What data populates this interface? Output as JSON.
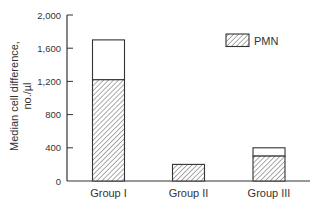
{
  "chart_data": {
    "type": "bar",
    "stacked": true,
    "title": "",
    "xlabel": "",
    "ylabel": "Median cell difference, no./µl",
    "ylabel_lines": [
      "Median cell difference,",
      "no./µl"
    ],
    "ylim": [
      0,
      2000
    ],
    "yticks": [
      0,
      400,
      800,
      1200,
      1600,
      2000
    ],
    "ytick_labels": [
      "0",
      "400",
      "800",
      "1,200",
      "1,600",
      "2,000"
    ],
    "categories": [
      "Group I",
      "Group II",
      "Group III"
    ],
    "series": [
      {
        "name": "PMN",
        "pattern": "hatched",
        "values": [
          1220,
          200,
          300
        ]
      },
      {
        "name": "Other (non-PMN)",
        "pattern": "open",
        "values": [
          480,
          0,
          100
        ]
      }
    ],
    "totals": [
      1700,
      200,
      400
    ],
    "legend": {
      "position": "upper right",
      "entries": [
        {
          "label": "PMN",
          "pattern": "hatched"
        }
      ]
    },
    "grid": false
  },
  "colors": {
    "axis": "#333333",
    "bar_outline": "#333333",
    "hatch": "#555555",
    "open_fill": "#ffffff",
    "text": "#333333"
  }
}
